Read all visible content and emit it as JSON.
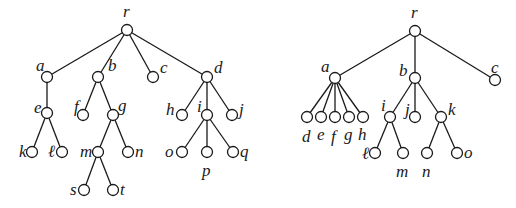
{
  "diagram": {
    "type": "rooted-trees",
    "colors": {
      "line": "#1a1a1a",
      "node_fill": "#ffffff",
      "background": "#ffffff"
    },
    "node_radius": 5.5,
    "trees": [
      {
        "id": "left-tree",
        "nodes": [
          {
            "id": "r",
            "label": "r",
            "x": 127,
            "y": 30,
            "lx": 123,
            "ly": 3
          },
          {
            "id": "a",
            "label": "a",
            "x": 47,
            "y": 77,
            "lx": 36,
            "ly": 57
          },
          {
            "id": "b",
            "label": "b",
            "x": 98,
            "y": 77,
            "lx": 108,
            "ly": 57
          },
          {
            "id": "c",
            "label": "c",
            "x": 153,
            "y": 77,
            "lx": 160,
            "ly": 59
          },
          {
            "id": "d",
            "label": "d",
            "x": 207,
            "y": 77,
            "lx": 214,
            "ly": 59
          },
          {
            "id": "e",
            "label": "e",
            "x": 47,
            "y": 113,
            "lx": 34,
            "ly": 99
          },
          {
            "id": "f",
            "label": "f",
            "x": 83,
            "y": 115,
            "lx": 74,
            "ly": 98
          },
          {
            "id": "g",
            "label": "g",
            "x": 113,
            "y": 115,
            "lx": 118,
            "ly": 97
          },
          {
            "id": "h",
            "label": "h",
            "x": 182,
            "y": 115,
            "lx": 166,
            "ly": 101
          },
          {
            "id": "i",
            "label": "i",
            "x": 207,
            "y": 115,
            "lx": 197,
            "ly": 98
          },
          {
            "id": "j",
            "label": "j",
            "x": 232,
            "y": 115,
            "lx": 239,
            "ly": 101
          },
          {
            "id": "k",
            "label": "k",
            "x": 32,
            "y": 152,
            "lx": 19,
            "ly": 143
          },
          {
            "id": "l",
            "label": "ℓ",
            "x": 62,
            "y": 152,
            "lx": 48,
            "ly": 143
          },
          {
            "id": "m",
            "label": "m",
            "x": 98,
            "y": 152,
            "lx": 80,
            "ly": 143
          },
          {
            "id": "n",
            "label": "n",
            "x": 128,
            "y": 152,
            "lx": 135,
            "ly": 143
          },
          {
            "id": "o",
            "label": "o",
            "x": 182,
            "y": 152,
            "lx": 165,
            "ly": 143
          },
          {
            "id": "p",
            "label": "p",
            "x": 207,
            "y": 152,
            "lx": 202,
            "ly": 162
          },
          {
            "id": "q",
            "label": "q",
            "x": 233,
            "y": 152,
            "lx": 240,
            "ly": 143
          },
          {
            "id": "s",
            "label": "s",
            "x": 84,
            "y": 190,
            "lx": 70,
            "ly": 181
          },
          {
            "id": "t",
            "label": "t",
            "x": 113,
            "y": 190,
            "lx": 120,
            "ly": 181
          }
        ],
        "edges": [
          [
            "r",
            "a"
          ],
          [
            "r",
            "b"
          ],
          [
            "r",
            "c"
          ],
          [
            "r",
            "d"
          ],
          [
            "a",
            "e"
          ],
          [
            "e",
            "k"
          ],
          [
            "e",
            "l"
          ],
          [
            "b",
            "f"
          ],
          [
            "b",
            "g"
          ],
          [
            "g",
            "m"
          ],
          [
            "g",
            "n"
          ],
          [
            "m",
            "s"
          ],
          [
            "m",
            "t"
          ],
          [
            "d",
            "h"
          ],
          [
            "d",
            "i"
          ],
          [
            "d",
            "j"
          ],
          [
            "i",
            "o"
          ],
          [
            "i",
            "p"
          ],
          [
            "i",
            "q"
          ]
        ]
      },
      {
        "id": "right-tree",
        "nodes": [
          {
            "id": "r",
            "label": "r",
            "x": 415,
            "y": 31,
            "lx": 411,
            "ly": 4
          },
          {
            "id": "a",
            "label": "a",
            "x": 335,
            "y": 78,
            "lx": 321,
            "ly": 58
          },
          {
            "id": "b",
            "label": "b",
            "x": 415,
            "y": 78,
            "lx": 399,
            "ly": 62
          },
          {
            "id": "c",
            "label": "c",
            "x": 495,
            "y": 80,
            "lx": 491,
            "ly": 59
          },
          {
            "id": "d",
            "label": "d",
            "x": 307,
            "y": 117,
            "lx": 302,
            "ly": 128
          },
          {
            "id": "e",
            "label": "e",
            "x": 321,
            "y": 117,
            "lx": 317,
            "ly": 126
          },
          {
            "id": "f",
            "label": "f",
            "x": 335,
            "y": 117,
            "lx": 331,
            "ly": 128
          },
          {
            "id": "g",
            "label": "g",
            "x": 349,
            "y": 117,
            "lx": 344,
            "ly": 126
          },
          {
            "id": "h",
            "label": "h",
            "x": 363,
            "y": 117,
            "lx": 358,
            "ly": 126
          },
          {
            "id": "i",
            "label": "i",
            "x": 390,
            "y": 117,
            "lx": 381,
            "ly": 97
          },
          {
            "id": "j",
            "label": "j",
            "x": 415,
            "y": 117,
            "lx": 405,
            "ly": 101
          },
          {
            "id": "k",
            "label": "k",
            "x": 441,
            "y": 117,
            "lx": 448,
            "ly": 101
          },
          {
            "id": "l",
            "label": "ℓ",
            "x": 375,
            "y": 153,
            "lx": 362,
            "ly": 145
          },
          {
            "id": "m",
            "label": "m",
            "x": 403,
            "y": 153,
            "lx": 396,
            "ly": 163
          },
          {
            "id": "n",
            "label": "n",
            "x": 427,
            "y": 153,
            "lx": 422,
            "ly": 163
          },
          {
            "id": "o",
            "label": "o",
            "x": 457,
            "y": 153,
            "lx": 464,
            "ly": 144
          }
        ],
        "edges": [
          [
            "r",
            "a"
          ],
          [
            "r",
            "b"
          ],
          [
            "r",
            "c"
          ],
          [
            "a",
            "d"
          ],
          [
            "a",
            "e"
          ],
          [
            "a",
            "f"
          ],
          [
            "a",
            "g"
          ],
          [
            "a",
            "h"
          ],
          [
            "b",
            "i"
          ],
          [
            "b",
            "j"
          ],
          [
            "b",
            "k"
          ],
          [
            "i",
            "l"
          ],
          [
            "i",
            "m"
          ],
          [
            "k",
            "n"
          ],
          [
            "k",
            "o"
          ]
        ]
      }
    ]
  }
}
